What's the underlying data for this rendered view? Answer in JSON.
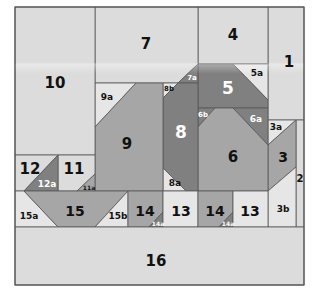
{
  "diagram": {
    "colors": {
      "light": "#dcdcdc",
      "lighter": "#e6e6e6",
      "medium": "#a6a6a6",
      "dark": "#808080",
      "stroke": "#555555",
      "text_dark": "#111111",
      "text_light": "#ffffff"
    },
    "pieces": [
      {
        "id": "1",
        "shade": "light",
        "points": "268,7 304,7 304,120 268,120",
        "label_xy": [
          289,
          62
        ],
        "size": 15,
        "text": "text_dark"
      },
      {
        "id": "2",
        "shade": "light",
        "points": "296,120 304,120 304,227 296,227",
        "label_xy": [
          300,
          178
        ],
        "size": 10,
        "text": "text_dark"
      },
      {
        "id": "3a",
        "shade": "lighter",
        "points": "268,120 296,120 268,145",
        "label_xy": [
          276,
          127
        ],
        "size": 9,
        "text": "text_dark"
      },
      {
        "id": "3",
        "shade": "medium",
        "points": "296,120 296,167 268,191 268,145",
        "label_xy": [
          283,
          157
        ],
        "size": 14,
        "text": "text_dark"
      },
      {
        "id": "3b",
        "shade": "lighter",
        "points": "268,191 296,167 296,227 268,227",
        "label_xy": [
          283,
          209
        ],
        "size": 9,
        "text": "text_dark"
      },
      {
        "id": "4",
        "shade": "light",
        "points": "198,7 268,7 268,64 198,64",
        "label_xy": [
          233,
          35
        ],
        "size": 15,
        "text": "text_dark"
      },
      {
        "id": "5a",
        "shade": "lighter",
        "points": "233,64 268,64 268,100",
        "label_xy": [
          257,
          73
        ],
        "size": 9,
        "text": "text_dark"
      },
      {
        "id": "5",
        "shade": "dark",
        "points": "198,64 233,64 268,100 268,108 198,108",
        "label_xy": [
          228,
          88
        ],
        "size": 17,
        "text": "text_light"
      },
      {
        "id": "6b",
        "shade": "dark",
        "points": "198,108 215,108 198,127",
        "label_xy": [
          203,
          115
        ],
        "size": 7,
        "text": "text_light"
      },
      {
        "id": "6a",
        "shade": "dark",
        "points": "233,108 268,108 268,145",
        "label_xy": [
          256,
          119
        ],
        "size": 9,
        "text": "text_light"
      },
      {
        "id": "6",
        "shade": "medium",
        "points": "215,108 233,108 268,145 268,191 198,191 198,127",
        "label_xy": [
          233,
          157
        ],
        "size": 15,
        "text": "text_dark"
      },
      {
        "id": "7",
        "shade": "light",
        "points": "95,7 198,7 198,64 178,83 95,83",
        "label_xy": [
          146,
          44
        ],
        "size": 15,
        "text": "text_dark"
      },
      {
        "id": "7a",
        "shade": "dark",
        "points": "198,64 198,83 178,83",
        "label_xy": [
          192,
          78
        ],
        "size": 7,
        "text": "text_light"
      },
      {
        "id": "8b",
        "shade": "lighter",
        "points": "163,83 178,83 163,98",
        "label_xy": [
          169,
          89
        ],
        "size": 7,
        "text": "text_dark"
      },
      {
        "id": "8",
        "shade": "dark",
        "points": "178,83 198,83 198,191 186,191 163,168 163,98",
        "label_xy": [
          181,
          132
        ],
        "size": 17,
        "text": "text_light"
      },
      {
        "id": "8a",
        "shade": "lighter",
        "points": "163,168 186,191 163,191",
        "label_xy": [
          175,
          183
        ],
        "size": 9,
        "text": "text_dark"
      },
      {
        "id": "9a",
        "shade": "lighter",
        "points": "95,83 136,83 95,127",
        "label_xy": [
          107,
          97
        ],
        "size": 9,
        "text": "text_dark"
      },
      {
        "id": "9",
        "shade": "medium",
        "points": "136,83 163,83 163,191 95,191 95,127",
        "label_xy": [
          127,
          144
        ],
        "size": 15,
        "text": "text_dark"
      },
      {
        "id": "10",
        "shade": "light",
        "points": "15,7 95,7 95,155 15,155",
        "label_xy": [
          55,
          83
        ],
        "size": 15,
        "text": "text_dark"
      },
      {
        "id": "11",
        "shade": "light",
        "points": "58,155 95,155 95,174 77,191 58,191",
        "label_xy": [
          74,
          169
        ],
        "size": 15,
        "text": "text_dark"
      },
      {
        "id": "11a",
        "shade": "medium",
        "points": "95,174 95,191 77,191",
        "label_xy": [
          89,
          187
        ],
        "size": 6,
        "text": "text_dark"
      },
      {
        "id": "12",
        "shade": "light",
        "points": "15,155 58,155 24,191 15,191",
        "label_xy": [
          30,
          169
        ],
        "size": 15,
        "text": "text_dark"
      },
      {
        "id": "12a",
        "shade": "dark",
        "points": "58,155 58,191 24,191",
        "label_xy": [
          47,
          184
        ],
        "size": 9,
        "text": "text_light"
      },
      {
        "id": "15a",
        "shade": "lighter",
        "points": "15,191 24,191 58,227 15,227",
        "label_xy": [
          29,
          216
        ],
        "size": 9,
        "text": "text_dark"
      },
      {
        "id": "15",
        "shade": "medium",
        "points": "24,191 128,191 95,227 58,227",
        "label_xy": [
          75,
          211
        ],
        "size": 14,
        "text": "text_dark"
      },
      {
        "id": "15b",
        "shade": "lighter",
        "points": "128,191 128,227 95,227",
        "label_xy": [
          118,
          216
        ],
        "size": 9,
        "text": "text_dark"
      },
      {
        "id": "14-left",
        "shade": "medium",
        "points": "128,191 163,191 163,212 149,227 128,227",
        "label_xy": [
          145,
          211
        ],
        "size": 14,
        "text": "text_dark",
        "display": "14"
      },
      {
        "id": "14a-left",
        "shade": "dark",
        "points": "163,212 163,227 149,227",
        "label_xy": [
          158,
          223
        ],
        "size": 6,
        "text": "text_light",
        "display": "14a"
      },
      {
        "id": "13-left",
        "shade": "lighter",
        "points": "163,191 198,191 198,227 163,227",
        "label_xy": [
          181,
          211
        ],
        "size": 14,
        "text": "text_dark",
        "display": "13"
      },
      {
        "id": "14-right",
        "shade": "medium",
        "points": "198,191 233,191 233,212 219,227 198,227",
        "label_xy": [
          215,
          211
        ],
        "size": 14,
        "text": "text_dark",
        "display": "14"
      },
      {
        "id": "14a-right",
        "shade": "dark",
        "points": "233,212 233,227 219,227",
        "label_xy": [
          228,
          223
        ],
        "size": 6,
        "text": "text_light",
        "display": "14a"
      },
      {
        "id": "13-right",
        "shade": "lighter",
        "points": "233,191 268,191 268,227 233,227",
        "label_xy": [
          250,
          211
        ],
        "size": 14,
        "text": "text_dark",
        "display": "13"
      },
      {
        "id": "16",
        "shade": "light",
        "points": "15,227 304,227 304,285 15,285",
        "label_xy": [
          156,
          261
        ],
        "size": 15,
        "text": "text_dark"
      }
    ]
  }
}
